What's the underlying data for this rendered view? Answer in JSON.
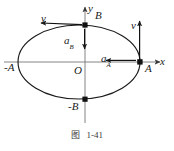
{
  "figure": {
    "caption_label": "图",
    "caption_number": "1-41",
    "axes": {
      "x_axis_label": "x",
      "y_axis_label": "y",
      "origin_label": "O"
    },
    "points": [
      {
        "id": "A",
        "label": "A",
        "x": 140,
        "y": 62,
        "marker": "filled-square"
      },
      {
        "id": "negA",
        "label": "-A",
        "x": 19,
        "y": 62,
        "marker": "none"
      },
      {
        "id": "B",
        "label": "B",
        "x": 85,
        "y": 25,
        "marker": "filled-square"
      },
      {
        "id": "negB",
        "label": "-B",
        "x": 85,
        "y": 100,
        "marker": "filled-square"
      }
    ],
    "vectors": [
      {
        "id": "v-at-B",
        "symbol": "v",
        "subscript": "",
        "direction": "left",
        "at_point": "B"
      },
      {
        "id": "v-at-A",
        "symbol": "v",
        "subscript": "",
        "direction": "up",
        "at_point": "A"
      },
      {
        "id": "a-at-B",
        "symbol": "a",
        "subscript": "B",
        "direction": "down",
        "at_point": "B"
      },
      {
        "id": "a-at-A",
        "symbol": "a",
        "subscript": "A",
        "direction": "left",
        "at_point": "A"
      }
    ],
    "ellipse": {
      "center_x": 79,
      "center_y": 62,
      "semi_axis_x": 61,
      "semi_axis_y": 37
    },
    "colors": {
      "stroke": "#1a1a1a",
      "axis": "#555555",
      "background": "#ffffff",
      "text": "#1a1a1a"
    }
  }
}
